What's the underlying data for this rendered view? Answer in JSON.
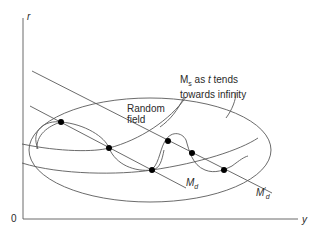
{
  "axes": {
    "y_axis_label": "r",
    "x_axis_label": "y",
    "origin_label": "0"
  },
  "labels": {
    "random_field_line1": "Random",
    "random_field_line2": "field",
    "ms_prefix": "M",
    "ms_sub": "s",
    "ms_line1_rest": " as ",
    "ms_t": "t",
    "ms_line1_end": " tends",
    "ms_line2": "towards infinity",
    "md_label": "M",
    "md_sub": "d",
    "md_prime_label": "M",
    "md_prime_sub": "d",
    "md_prime_mark": "′"
  },
  "colors": {
    "line": "#555555",
    "dot": "#000000",
    "text": "#2a2a2a"
  },
  "points": [
    {
      "x": 61,
      "y": 122
    },
    {
      "x": 109,
      "y": 148
    },
    {
      "x": 152,
      "y": 170
    },
    {
      "x": 168,
      "y": 141
    },
    {
      "x": 192,
      "y": 153
    },
    {
      "x": 224,
      "y": 170
    }
  ]
}
